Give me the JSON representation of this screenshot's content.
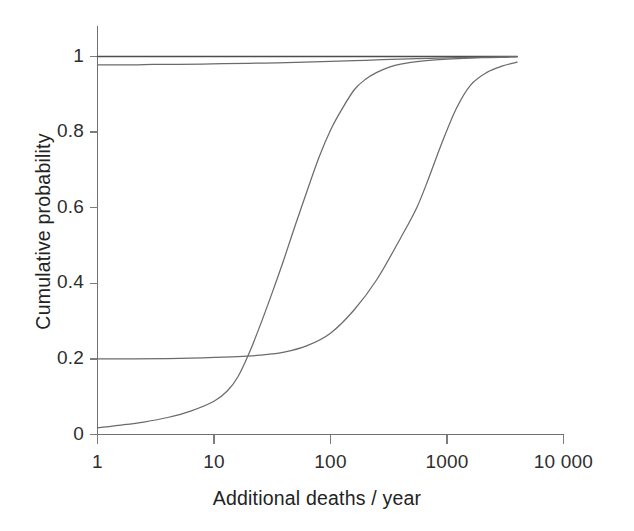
{
  "chart_data": {
    "type": "line",
    "title": "",
    "xlabel": "Additional deaths / year",
    "ylabel": "Cumulative probability",
    "xscale": "log",
    "xlim": [
      1,
      10000
    ],
    "ylim": [
      0,
      1
    ],
    "grid": false,
    "legend": "none",
    "xticks": [
      1,
      10,
      100,
      1000,
      10000
    ],
    "xtick_labels": [
      "1",
      "10",
      "100",
      "1000",
      "10 000"
    ],
    "yticks": [
      0,
      0.2,
      0.4,
      0.6,
      0.8,
      1
    ],
    "ytick_labels": [
      "0",
      "0.2",
      "0.4",
      "0.6",
      "0.8",
      "1"
    ],
    "series": [
      {
        "name": "near-certain curve (top, p=1)",
        "color": "#4c4d4e",
        "x": [
          1,
          2,
          5,
          10,
          20,
          50,
          100,
          200,
          400,
          700,
          1000,
          2000,
          4000
        ],
        "y": [
          1.0,
          1.0,
          1.0,
          1.0,
          1.0,
          1.0,
          1.0,
          1.0,
          1.0,
          1.0,
          1.0,
          1.0,
          1.0
        ]
      },
      {
        "name": "high-probability curve (p≈0.98 rising to 1)",
        "color": "#6a6b6c",
        "x": [
          1,
          2,
          3,
          5,
          8,
          12,
          20,
          35,
          60,
          100,
          160,
          250,
          400,
          700,
          1200,
          2000,
          3000,
          4000
        ],
        "y": [
          0.978,
          0.978,
          0.979,
          0.979,
          0.98,
          0.981,
          0.982,
          0.983,
          0.985,
          0.987,
          0.989,
          0.991,
          0.993,
          0.995,
          0.997,
          0.998,
          0.999,
          1.0
        ]
      },
      {
        "name": "mid sigmoid (median ≈ 55 deaths/year)",
        "color": "#6a6b6c",
        "x": [
          1,
          1.6,
          2.5,
          4,
          6.3,
          10,
          13,
          16,
          20,
          25,
          32,
          40,
          50,
          63,
          80,
          100,
          125,
          160,
          200,
          250,
          320,
          400,
          600,
          1000,
          2000,
          4000
        ],
        "y": [
          0.018,
          0.025,
          0.033,
          0.045,
          0.062,
          0.088,
          0.115,
          0.152,
          0.215,
          0.29,
          0.38,
          0.465,
          0.555,
          0.645,
          0.735,
          0.805,
          0.86,
          0.912,
          0.94,
          0.958,
          0.972,
          0.98,
          0.988,
          0.993,
          0.997,
          0.999
        ],
        "median_x": 55
      },
      {
        "name": "upper sigmoid (plateau 0.2, median ≈ 700 deaths/year)",
        "color": "#6a6b6c",
        "x": [
          1,
          2,
          4,
          8,
          16,
          25,
          40,
          63,
          100,
          160,
          250,
          400,
          550,
          700,
          900,
          1200,
          1600,
          2200,
          3000,
          4000
        ],
        "y": [
          0.2,
          0.2,
          0.201,
          0.203,
          0.206,
          0.21,
          0.218,
          0.235,
          0.268,
          0.33,
          0.41,
          0.52,
          0.6,
          0.68,
          0.77,
          0.862,
          0.925,
          0.958,
          0.975,
          0.985
        ],
        "plateau_y": 0.2,
        "median_x": 700
      }
    ],
    "annotations": []
  },
  "axes": {
    "y_title": "Cumulative probability",
    "x_title": "Additional deaths / year"
  }
}
